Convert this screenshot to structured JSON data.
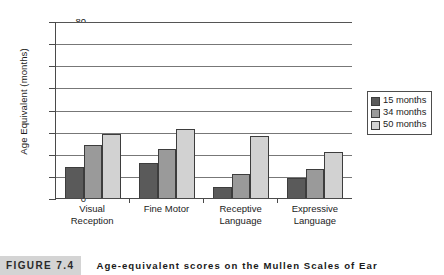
{
  "chart_data": {
    "type": "bar",
    "title": "",
    "xlabel": "",
    "ylabel": "Age Equivalent (months)",
    "categories": [
      "Visual Reception",
      "Fine Motor",
      "Receptive Language",
      "Expressive Language"
    ],
    "category_lines": [
      [
        "Visual",
        "Reception"
      ],
      [
        "Fine Motor",
        ""
      ],
      [
        "Receptive",
        "Language"
      ],
      [
        "Expressive",
        "Language"
      ]
    ],
    "series": [
      {
        "name": "15 months",
        "values": [
          14,
          16,
          5,
          9
        ],
        "color": "#5a5a5a"
      },
      {
        "name": "34 months",
        "values": [
          24,
          22,
          11,
          13
        ],
        "color": "#9a9a9a"
      },
      {
        "name": "50 months",
        "values": [
          29,
          31,
          28,
          21
        ],
        "color": "#d2d2d2"
      }
    ],
    "ylim": [
      0,
      80
    ],
    "yticks": [
      0,
      10,
      20,
      30,
      40,
      50,
      60,
      70,
      80
    ],
    "ytick_labels": [
      "0",
      "10",
      "20",
      "30",
      "40",
      "50",
      "60",
      "70",
      "80"
    ],
    "grid": true,
    "grid_axis": "y",
    "legend_position": "right"
  },
  "legend": {
    "items": [
      {
        "label": "15 months",
        "color": "#5a5a5a"
      },
      {
        "label": "34 months",
        "color": "#9a9a9a"
      },
      {
        "label": "50 months",
        "color": "#d2d2d2"
      }
    ]
  },
  "caption": {
    "tag": "FIGURE 7.4",
    "text": "Age-equivalent scores on the Mullen Scales of Ear"
  }
}
